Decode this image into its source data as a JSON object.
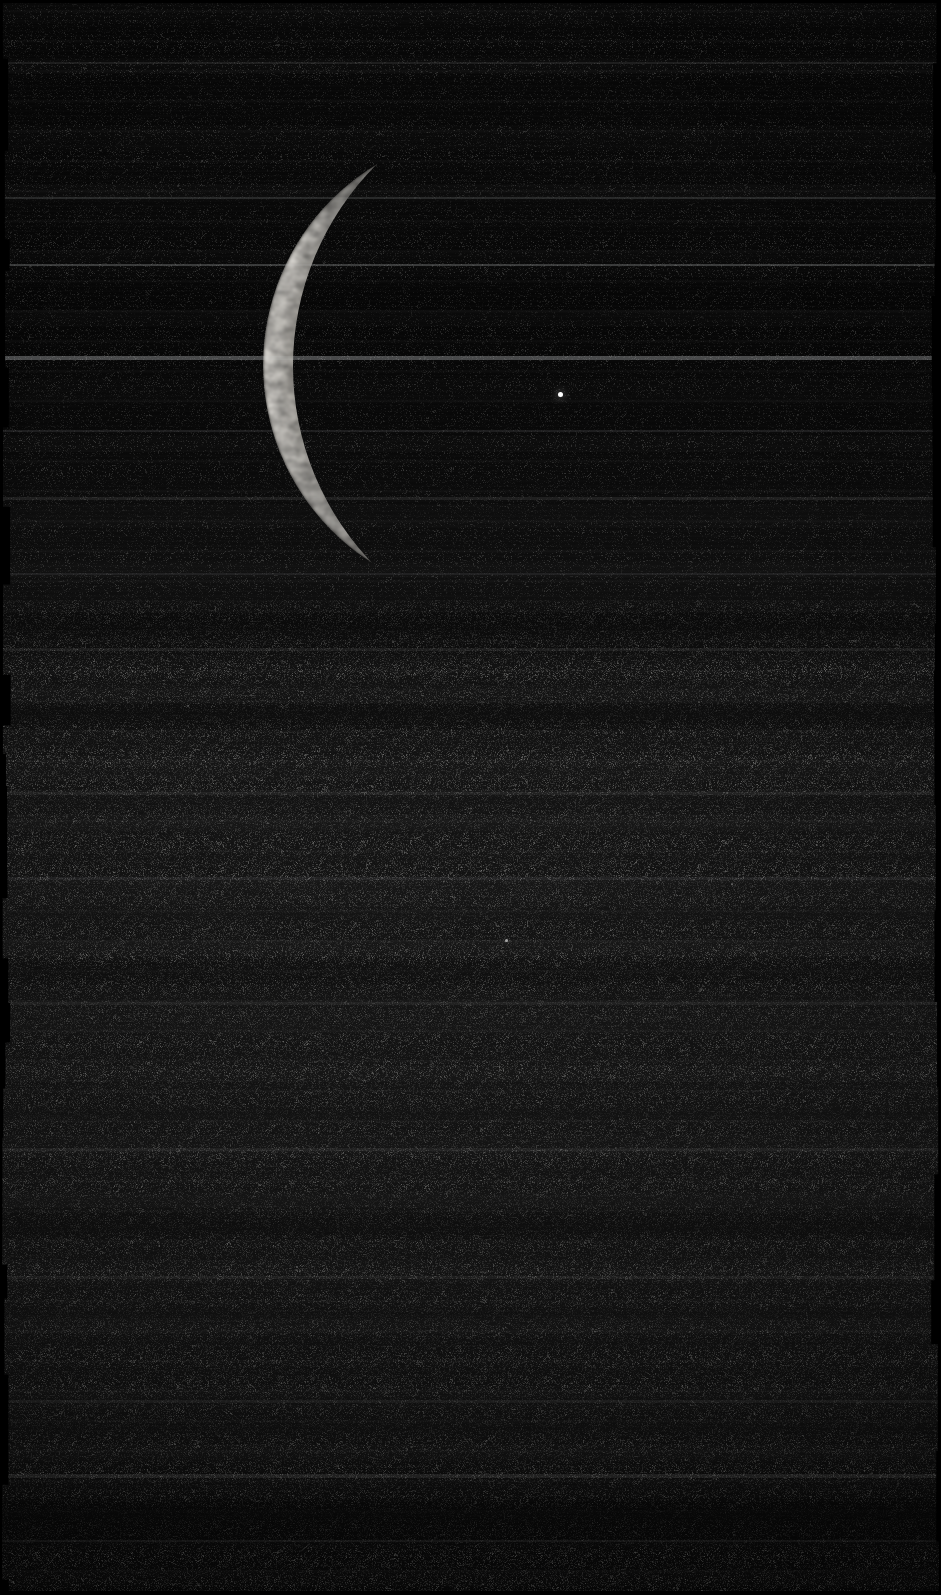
{
  "image": {
    "kind": "spacecraft-raw-frame",
    "subject": "crescent-moon",
    "width": 941,
    "height": 1595,
    "alt_text": "Thin crescent moon against a black star field, raw spacecraft image frame with horizontal scan-line banding",
    "background_color": "#070707",
    "limb_color": "#e6e3dd",
    "terminator_shadow_color": "#0a0a0a"
  },
  "moon": {
    "name": "crescent-moon",
    "outer_limb": {
      "center_x": 497,
      "center_y": 365,
      "radius": 234,
      "top_tip_x": 450,
      "top_tip_y": 132,
      "bottom_tip_x": 428,
      "bottom_tip_y": 597,
      "leftmost_x": 263,
      "leftmost_y": 368
    },
    "terminator": {
      "center_x": 578,
      "center_y": 366,
      "radius": 285,
      "note": "inner shadow arc defining crescent width"
    },
    "max_limb_thickness_px": 38,
    "illuminated_fraction": 0.06,
    "highlight_color": "#efece6",
    "mid_tone_color": "#b9b5ae",
    "edge_fade_color": "#3a3934"
  },
  "stars": [
    {
      "name": "bright-star",
      "x": 560,
      "y": 394,
      "size": 5,
      "opacity": 1.0
    },
    {
      "name": "faint-star",
      "x": 506,
      "y": 940,
      "size": 3,
      "opacity": 0.62
    },
    {
      "name": "faint-star",
      "x": 732,
      "y": 884,
      "size": 2,
      "opacity": 0.3
    },
    {
      "name": "faint-star",
      "x": 188,
      "y": 706,
      "size": 2,
      "opacity": 0.26
    }
  ],
  "scanlines": [
    {
      "name": "bright-scanline",
      "y": 264,
      "height": 2,
      "opacity": 0.17
    },
    {
      "name": "bright-scanline",
      "y": 356,
      "height": 4,
      "opacity": 0.23
    },
    {
      "name": "bright-scanline",
      "y": 197,
      "height": 2,
      "opacity": 0.1
    },
    {
      "name": "bright-scanline",
      "y": 62,
      "height": 2,
      "opacity": 0.07
    },
    {
      "name": "bright-scanline",
      "y": 430,
      "height": 2,
      "opacity": 0.06
    },
    {
      "name": "bright-scanline",
      "y": 497,
      "height": 3,
      "opacity": 0.07
    },
    {
      "name": "bright-scanline",
      "y": 573,
      "height": 2,
      "opacity": 0.06
    },
    {
      "name": "bright-scanline",
      "y": 648,
      "height": 3,
      "opacity": 0.05
    },
    {
      "name": "bright-scanline",
      "y": 792,
      "height": 3,
      "opacity": 0.05
    },
    {
      "name": "bright-scanline",
      "y": 877,
      "height": 3,
      "opacity": 0.06
    },
    {
      "name": "bright-scanline",
      "y": 1002,
      "height": 3,
      "opacity": 0.05
    },
    {
      "name": "bright-scanline",
      "y": 1148,
      "height": 3,
      "opacity": 0.05
    },
    {
      "name": "bright-scanline",
      "y": 1276,
      "height": 3,
      "opacity": 0.05
    },
    {
      "name": "bright-scanline",
      "y": 1400,
      "height": 3,
      "opacity": 0.05
    },
    {
      "name": "bright-scanline",
      "y": 1474,
      "height": 4,
      "opacity": 0.09
    },
    {
      "name": "bright-scanline",
      "y": 1540,
      "height": 2,
      "opacity": 0.05
    }
  ],
  "dark_bands": [
    {
      "name": "dark-band",
      "y": 610,
      "height": 44,
      "opacity": 0.3
    },
    {
      "name": "dark-band",
      "y": 700,
      "height": 30,
      "opacity": 0.22
    },
    {
      "name": "dark-band",
      "y": 960,
      "height": 26,
      "opacity": 0.18
    },
    {
      "name": "dark-band",
      "y": 1210,
      "height": 30,
      "opacity": 0.16
    },
    {
      "name": "dark-band",
      "y": 1500,
      "height": 40,
      "opacity": 0.3
    }
  ]
}
